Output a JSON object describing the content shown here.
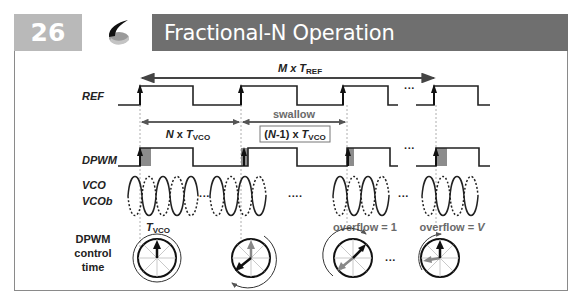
{
  "header": {
    "slide_number": "26",
    "title": "Fractional-N Operation",
    "logo_icon": "swoosh-logo-icon"
  },
  "colors": {
    "number_box": "#b9b9b9",
    "title_bar": "#6f6f6f",
    "signal": "#222222",
    "shade": "#8c8c8c",
    "annotation_gray": "#6a6a6a"
  },
  "diagram": {
    "top_span": {
      "prefix": "M x ",
      "T": "T",
      "sub": "REF"
    },
    "signals": {
      "ref": "REF",
      "dpwm": "DPWM",
      "vco": "VCO",
      "vcob": "VCOb"
    },
    "n_span": {
      "prefix": "N",
      "mid": " x ",
      "T": "T",
      "sub": "VCO"
    },
    "swallow_label": "swallow",
    "swallow_box": {
      "prefix": "(",
      "N": "N",
      "rest": "-1) x ",
      "T": "T",
      "sub": "VCO"
    },
    "ellipsis": "···",
    "ellipsis_long": "····",
    "control_label": [
      "DPWM",
      "control",
      "time"
    ],
    "dial_tvco": {
      "T": "T",
      "sub": "VCO"
    },
    "overflow_1": "overflow = 1",
    "overflow_v": {
      "prefix": "overflow = ",
      "V": "V"
    }
  }
}
